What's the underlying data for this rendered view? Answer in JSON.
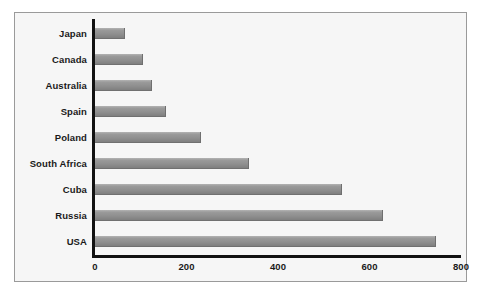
{
  "chart_data": {
    "type": "bar",
    "orientation": "horizontal",
    "title": "",
    "xlabel": "",
    "ylabel": "",
    "categories": [
      "Japan",
      "Canada",
      "Australia",
      "Spain",
      "Poland",
      "South Africa",
      "Cuba",
      "Russia",
      "USA"
    ],
    "values": [
      65,
      105,
      125,
      155,
      232,
      337,
      540,
      630,
      745
    ],
    "xlim": [
      0,
      800
    ],
    "xticks": [
      0,
      200,
      400,
      600,
      800
    ],
    "xtick_labels": [
      "0",
      "200",
      "400",
      "600",
      "800"
    ],
    "grid": false,
    "legend": false,
    "bar_color": "#8f8f8f",
    "axis_color": "#111111",
    "panel_background": "#f6f6f6",
    "panel_border": "#9a9a9a",
    "page_background": "#ffffff",
    "label_color": "#1a1a1a"
  }
}
